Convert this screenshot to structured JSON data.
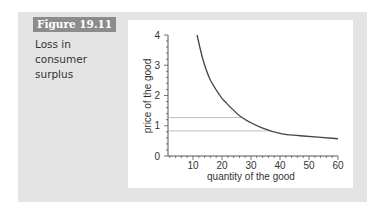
{
  "figure": {
    "label": "Figure 19.11",
    "caption_lines": [
      "Loss in",
      "consumer",
      "surplus"
    ]
  },
  "chart_data": {
    "type": "line",
    "title": "Loss in consumer surplus",
    "xlabel": "quantity of the good",
    "ylabel": "price of the good",
    "xlim": [
      0,
      60
    ],
    "ylim": [
      0,
      4
    ],
    "xticks": [
      10,
      20,
      30,
      40,
      50,
      60
    ],
    "yticks": [
      0,
      1,
      2,
      3,
      4
    ],
    "grid": false,
    "series": [
      {
        "name": "demand curve",
        "x": [
          11.4,
          13.4,
          15.9,
          19.3,
          21.0,
          26.9,
          33.8,
          40.7,
          47.0,
          60.0
        ],
        "y": [
          4.0,
          3.2,
          2.53,
          2.0,
          1.8,
          1.27,
          0.93,
          0.73,
          0.67,
          0.57
        ]
      }
    ],
    "reference_lines": [
      {
        "type": "horizontal",
        "y": 1.27,
        "x_end": 26.9
      },
      {
        "type": "horizontal",
        "y": 0.83,
        "x_end": 36.5
      }
    ]
  },
  "colors": {
    "outer_panel": "#e4e4e4",
    "label_bg": "#8c8c8c",
    "curve": "#444444",
    "ref_line": "#b8b8b8"
  }
}
